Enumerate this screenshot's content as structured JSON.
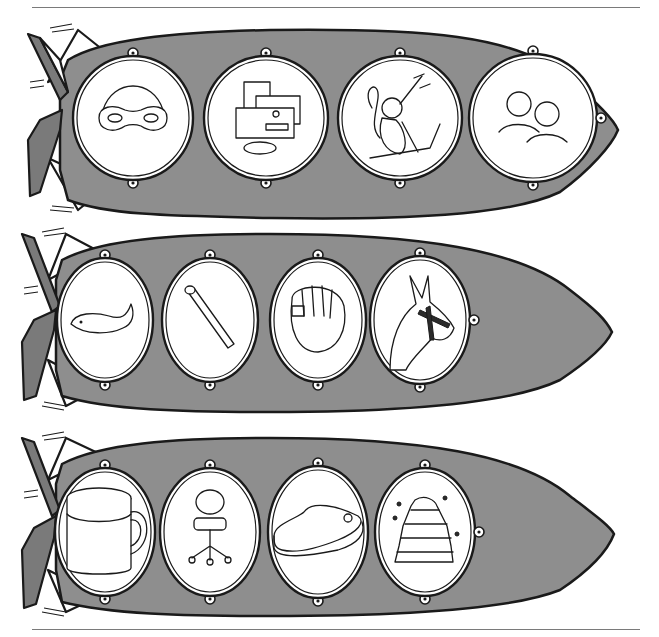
{
  "worksheet": {
    "title": "Rocket picture rows",
    "colors": {
      "rocket_body": "#8e8e8e",
      "fin_dark": "#7a7a7a",
      "outline": "#1a1a1a",
      "porthole": "#ffffff"
    },
    "rockets": [
      {
        "name": "rocket-1",
        "portholes": [
          {
            "item": "mask",
            "icon": "mask-icon"
          },
          {
            "item": "mail",
            "icon": "mail-icon"
          },
          {
            "item": "monkey",
            "icon": "monkey-icon"
          },
          {
            "item": "men",
            "icon": "men-icon"
          }
        ]
      },
      {
        "name": "rocket-2",
        "portholes": [
          {
            "item": "whale",
            "icon": "whale-icon"
          },
          {
            "item": "match",
            "icon": "match-icon"
          },
          {
            "item": "mitt",
            "icon": "mitt-icon"
          },
          {
            "item": "mule",
            "icon": "mule-icon"
          }
        ]
      },
      {
        "name": "rocket-3",
        "portholes": [
          {
            "item": "mug",
            "icon": "mug-icon"
          },
          {
            "item": "chair",
            "icon": "chair-icon"
          },
          {
            "item": "pool",
            "icon": "pool-icon"
          },
          {
            "item": "beehive",
            "icon": "beehive-icon"
          }
        ]
      }
    ]
  }
}
